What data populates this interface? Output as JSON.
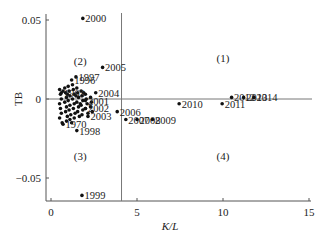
{
  "chart_data": {
    "type": "scatter",
    "title": "",
    "xlabel": "K/L",
    "ylabel": "TB",
    "xlim": [
      -0.3,
      15.1
    ],
    "ylim": [
      -0.065,
      0.054
    ],
    "xticks": [
      0,
      5,
      10,
      15
    ],
    "xtick_labels": [
      "0",
      "5",
      "10",
      "15"
    ],
    "yticks": [
      0.05,
      0,
      -0.05
    ],
    "ytick_labels": [
      "0.05",
      "0",
      "−0.05"
    ],
    "grid": false,
    "legend": null,
    "reference_lines": {
      "horizontal_y": 0,
      "vertical_x": 4.1
    },
    "quadrant_labels": [
      {
        "label": "(1)",
        "x": 10.0,
        "y": 0.026
      },
      {
        "label": "(2)",
        "x": 1.7,
        "y": 0.024
      },
      {
        "label": "(3)",
        "x": 1.7,
        "y": -0.036
      },
      {
        "label": "(4)",
        "x": 10.0,
        "y": -0.036
      }
    ],
    "labeled_points": [
      {
        "label": "2000",
        "x": 1.85,
        "y": 0.051
      },
      {
        "label": "2005",
        "x": 3.0,
        "y": 0.02
      },
      {
        "label": "1997",
        "x": 1.45,
        "y": 0.014
      },
      {
        "label": "1996",
        "x": 1.2,
        "y": 0.012
      },
      {
        "label": "1963",
        "x": 0.6,
        "y": 0.004
      },
      {
        "label": "2004",
        "x": 2.6,
        "y": 0.004
      },
      {
        "label": "2001",
        "x": 2.0,
        "y": -0.001
      },
      {
        "label": "2002",
        "x": 2.0,
        "y": -0.006
      },
      {
        "label": "2003",
        "x": 2.15,
        "y": -0.011
      },
      {
        "label": "1970",
        "x": 0.7,
        "y": -0.016
      },
      {
        "label": "1998",
        "x": 1.5,
        "y": -0.02
      },
      {
        "label": "1999",
        "x": 1.8,
        "y": -0.061
      },
      {
        "label": "2006",
        "x": 3.85,
        "y": -0.008
      },
      {
        "label": "2007",
        "x": 4.35,
        "y": -0.013
      },
      {
        "label": "2008",
        "x": 5.0,
        "y": -0.013
      },
      {
        "label": "2009",
        "x": 5.9,
        "y": -0.013
      },
      {
        "label": "2010",
        "x": 7.45,
        "y": -0.003
      },
      {
        "label": "2011",
        "x": 9.95,
        "y": -0.003
      },
      {
        "label": "2012",
        "x": 10.5,
        "y": 0.001
      },
      {
        "label": "2013",
        "x": 11.2,
        "y": 0.001
      },
      {
        "label": "2014",
        "x": 11.8,
        "y": 0.001
      }
    ],
    "cluster_points": [
      [
        0.5,
        0.006
      ],
      [
        0.55,
        0.003
      ],
      [
        0.6,
        0.0
      ],
      [
        0.5,
        -0.003
      ],
      [
        0.55,
        -0.006
      ],
      [
        0.6,
        -0.009
      ],
      [
        0.5,
        -0.012
      ],
      [
        0.65,
        -0.015
      ],
      [
        0.8,
        0.007
      ],
      [
        0.85,
        0.004
      ],
      [
        0.9,
        0.001
      ],
      [
        0.8,
        -0.002
      ],
      [
        0.9,
        -0.005
      ],
      [
        0.85,
        -0.008
      ],
      [
        0.95,
        -0.011
      ],
      [
        0.9,
        -0.014
      ],
      [
        1.0,
        0.008
      ],
      [
        1.05,
        0.005
      ],
      [
        1.1,
        0.002
      ],
      [
        1.0,
        -0.001
      ],
      [
        1.1,
        -0.004
      ],
      [
        1.05,
        -0.007
      ],
      [
        1.15,
        -0.01
      ],
      [
        1.1,
        -0.013
      ],
      [
        1.25,
        0.009
      ],
      [
        1.3,
        0.006
      ],
      [
        1.35,
        0.003
      ],
      [
        1.25,
        0.0
      ],
      [
        1.35,
        -0.003
      ],
      [
        1.3,
        -0.006
      ],
      [
        1.4,
        -0.009
      ],
      [
        1.35,
        -0.012
      ],
      [
        1.5,
        0.007
      ],
      [
        1.55,
        0.004
      ],
      [
        1.6,
        0.001
      ],
      [
        1.5,
        -0.002
      ],
      [
        1.6,
        -0.005
      ],
      [
        1.55,
        -0.008
      ],
      [
        1.65,
        -0.011
      ],
      [
        1.75,
        0.005
      ],
      [
        1.8,
        0.002
      ],
      [
        1.85,
        -0.001
      ],
      [
        1.75,
        -0.004
      ],
      [
        1.85,
        -0.007
      ],
      [
        1.8,
        -0.01
      ],
      [
        2.0,
        0.003
      ],
      [
        2.05,
        0.0
      ],
      [
        2.1,
        -0.003
      ],
      [
        2.0,
        -0.006
      ],
      [
        2.15,
        -0.009
      ],
      [
        2.3,
        0.001
      ],
      [
        2.35,
        -0.002
      ],
      [
        2.3,
        -0.005
      ],
      [
        2.4,
        -0.008
      ],
      [
        0.7,
        0.005
      ],
      [
        1.2,
        -0.015
      ],
      [
        0.95,
        0.003
      ],
      [
        1.45,
        0.002
      ],
      [
        1.7,
        -0.003
      ],
      [
        1.9,
        0.004
      ]
    ]
  }
}
